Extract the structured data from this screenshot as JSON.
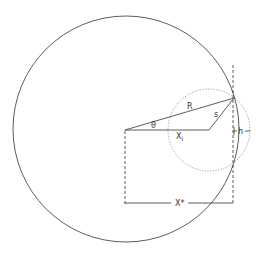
{
  "diagram": {
    "labels": {
      "radius": "R",
      "angle": "θ",
      "small_radius": "s",
      "x_i_base": "X",
      "x_i_sub": "i",
      "height": "h",
      "x_star": "X*"
    },
    "colors": {
      "stroke": "#333333",
      "dotted": "#777777",
      "background": "#ffffff"
    }
  }
}
